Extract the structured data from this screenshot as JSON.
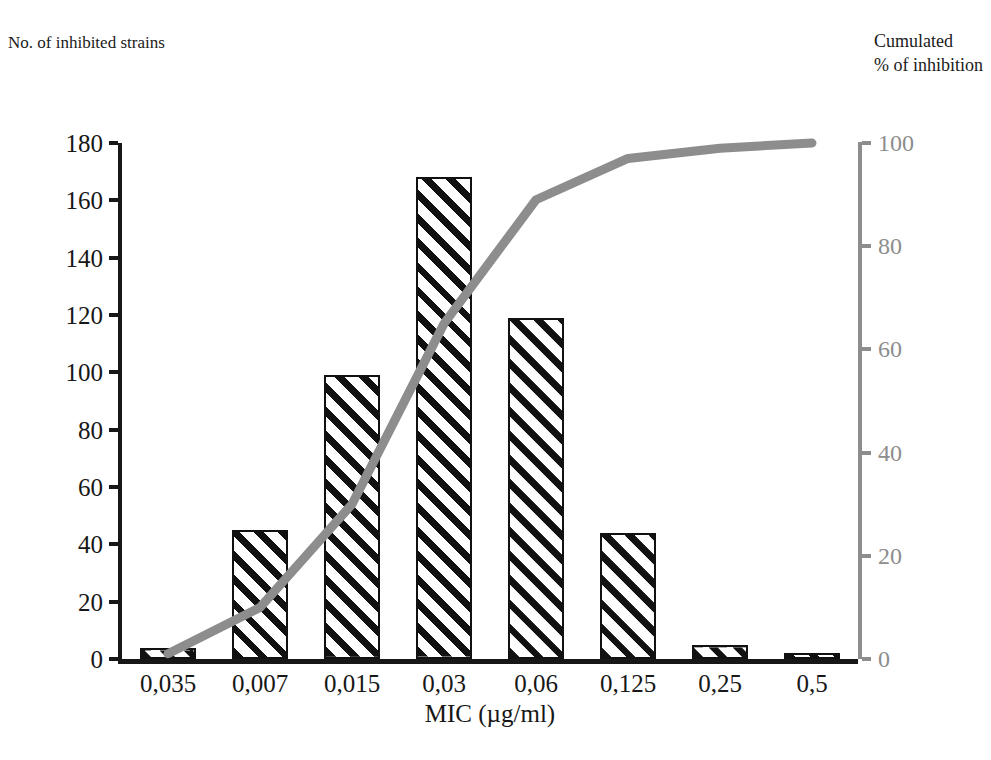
{
  "labels": {
    "left_axis_title": "No. of inhibited strains",
    "right_axis_title_line1": "Cumulated",
    "right_axis_title_line2": "% of inhibition",
    "x_axis_title": "MIC (µg/ml)"
  },
  "colors": {
    "bar_outline": "#111111",
    "bar_hatch": "#111111",
    "bar_fill": "#ffffff",
    "left_axis": "#171717",
    "right_axis": "#8d8d8d",
    "cumulative_line": "#8d8d8d",
    "background": "#ffffff"
  },
  "chart_data": {
    "type": "bar",
    "title": "",
    "xlabel": "MIC (µg/ml)",
    "ylabel": "No. of inhibited strains",
    "y2label": "Cumulated % of inhibition",
    "categories": [
      "0,035",
      "0,007",
      "0,015",
      "0,03",
      "0,06",
      "0,125",
      "0,25",
      "0,5"
    ],
    "ylim": [
      0,
      180
    ],
    "yticks": [
      0,
      20,
      40,
      60,
      80,
      100,
      120,
      140,
      160,
      180
    ],
    "y2lim": [
      0,
      100
    ],
    "y2ticks": [
      0,
      20,
      40,
      60,
      80,
      100
    ],
    "grid": false,
    "legend": false,
    "series": [
      {
        "name": "No. of inhibited strains",
        "type": "bar",
        "axis": "left",
        "values": [
          4,
          45,
          99,
          168,
          119,
          44,
          5,
          2
        ]
      },
      {
        "name": "Cumulated % of inhibition",
        "type": "line",
        "axis": "right",
        "values": [
          1,
          10,
          30,
          65,
          89,
          97,
          99,
          100
        ]
      }
    ]
  },
  "caption": ""
}
